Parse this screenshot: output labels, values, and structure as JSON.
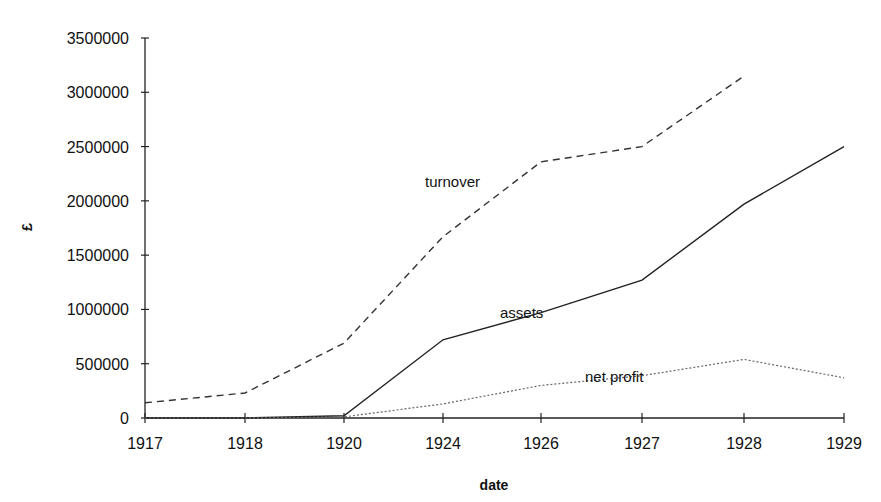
{
  "chart_data": {
    "type": "line",
    "title": "",
    "xlabel": "date",
    "ylabel": "£",
    "categories": [
      "1917",
      "1918",
      "1920",
      "1924",
      "1926",
      "1927",
      "1928",
      "1929"
    ],
    "yticks": [
      0,
      500000,
      1000000,
      1500000,
      2000000,
      2500000,
      3000000,
      3500000
    ],
    "ylim": [
      0,
      3500000
    ],
    "grid": false,
    "legend": "inline labels",
    "series": [
      {
        "name": "turnover",
        "style": "dashed",
        "values": [
          140000,
          230000,
          690000,
          1670000,
          2360000,
          2500000,
          3150000,
          null
        ],
        "label_pos": [
          425,
          187
        ]
      },
      {
        "name": "assets",
        "style": "solid",
        "values": [
          0,
          0,
          20000,
          720000,
          970000,
          1270000,
          1970000,
          2500000
        ],
        "label_pos": [
          500,
          318
        ]
      },
      {
        "name": "net profit",
        "style": "dotted",
        "values": [
          0,
          0,
          10000,
          130000,
          300000,
          390000,
          540000,
          370000
        ],
        "label_pos": [
          585,
          382
        ]
      }
    ]
  }
}
